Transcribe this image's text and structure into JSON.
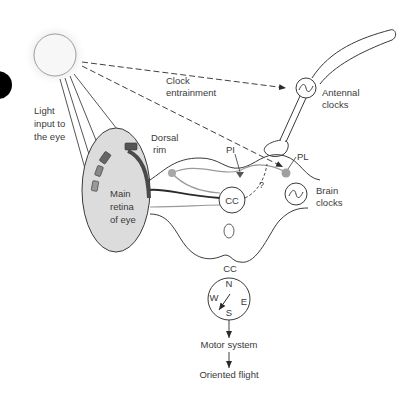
{
  "labels": {
    "light_input": [
      "Light",
      "input to",
      "the eye"
    ],
    "clock_entrainment": [
      "Clock",
      "entrainment"
    ],
    "antennal_clocks": [
      "Antennal",
      "clocks"
    ],
    "dorsal_rim": [
      "Dorsal",
      "rim"
    ],
    "main_retina": [
      "Main",
      "retina",
      "of eye"
    ],
    "pi": "PI",
    "pl": "PL",
    "question": "?",
    "cc_center": "CC",
    "brain_clocks": [
      "Brain",
      "clocks"
    ],
    "compass_title": "CC",
    "compass_n": "N",
    "compass_e": "E",
    "compass_s": "S",
    "compass_w": "W",
    "motor_system": "Motor system",
    "oriented_flight": "Oriented flight"
  },
  "colors": {
    "outline": "#3a3a3a",
    "retina_fill": "#dcdcdc",
    "dorsal_rim": "#4a4a4a",
    "light_pathway": "#9a9a9a",
    "pl_dot": "#a0a0a0",
    "sun_glow": "#e8e8e8"
  }
}
